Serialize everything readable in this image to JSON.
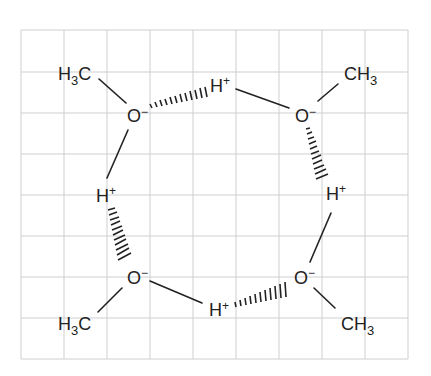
{
  "diagram": {
    "title": "",
    "grid": {
      "x0": 21,
      "y0": 30,
      "cols": 9,
      "rows": 8,
      "cell_w": 43,
      "cell_h": 41.1,
      "color": "#cfcfcf"
    },
    "atoms": [
      {
        "id": "me1",
        "label": "H",
        "sub": "3",
        "tail": "C",
        "x": 77,
        "y": 73
      },
      {
        "id": "o1",
        "label": "O",
        "charge": "−",
        "x": 134,
        "y": 116
      },
      {
        "id": "h1",
        "label": "H",
        "charge": "+",
        "x": 220,
        "y": 85
      },
      {
        "id": "o2",
        "label": "O",
        "charge": "−",
        "x": 302,
        "y": 114
      },
      {
        "id": "me2",
        "label": "CH",
        "sub": "3",
        "x": 370,
        "y": 73
      },
      {
        "id": "h2",
        "label": "H",
        "charge": "+",
        "x": 107,
        "y": 195
      },
      {
        "id": "h3",
        "label": "H",
        "charge": "+",
        "x": 336,
        "y": 193
      },
      {
        "id": "o3",
        "label": "O",
        "charge": "−",
        "x": 134,
        "y": 277
      },
      {
        "id": "o4",
        "label": "O",
        "charge": "−",
        "x": 302,
        "y": 277
      },
      {
        "id": "h4",
        "label": "H",
        "charge": "+",
        "x": 216,
        "y": 308
      },
      {
        "id": "me3",
        "label": "H",
        "sub": "3",
        "tail": "C",
        "x": 77,
        "y": 323
      },
      {
        "id": "me4",
        "label": "CH",
        "sub": "3",
        "x": 360,
        "y": 323
      }
    ],
    "labels": {
      "me1_h": "H",
      "me1_sub": "3",
      "me1_c": "C",
      "o1": "O",
      "o1_charge": "−",
      "h1": "H",
      "h1_charge": "+",
      "o2": "O",
      "o2_charge": "−",
      "me2_ch": "CH",
      "me2_sub": "3",
      "h2": "H",
      "h2_charge": "+",
      "h3": "H",
      "h3_charge": "+",
      "o3": "O",
      "o3_charge": "−",
      "o4": "O",
      "o4_charge": "−",
      "h4": "H",
      "h4_charge": "+",
      "me3_h": "H",
      "me3_sub": "3",
      "me3_c": "C",
      "me4_ch": "CH",
      "me4_sub": "3"
    },
    "bonds": [
      {
        "from": "me1",
        "to": "o1",
        "type": "covalent"
      },
      {
        "from": "o1",
        "to": "h1",
        "type": "hydrogen"
      },
      {
        "from": "h1",
        "to": "o2",
        "type": "covalent"
      },
      {
        "from": "o2",
        "to": "me2",
        "type": "covalent"
      },
      {
        "from": "o2",
        "to": "h3",
        "type": "hydrogen"
      },
      {
        "from": "o1",
        "to": "h2",
        "type": "covalent"
      },
      {
        "from": "h2",
        "to": "o3",
        "type": "hydrogen"
      },
      {
        "from": "o3",
        "to": "me3",
        "type": "covalent"
      },
      {
        "from": "o3",
        "to": "h4",
        "type": "covalent"
      },
      {
        "from": "h4",
        "to": "o4",
        "type": "hydrogen"
      },
      {
        "from": "h3",
        "to": "o4",
        "type": "covalent"
      },
      {
        "from": "o4",
        "to": "me4",
        "type": "covalent"
      }
    ]
  }
}
